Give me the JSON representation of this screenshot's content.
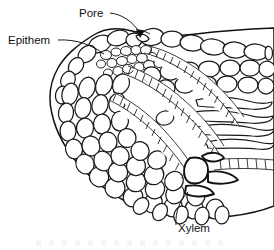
{
  "figure": {
    "name": "hydathode-cross-section",
    "background_color": "#ffffff",
    "line_color": "#1a1a1a",
    "width": 274,
    "height": 250,
    "style": "black-and-white botanical line drawing"
  },
  "labels": [
    {
      "id": "pore",
      "text": "Pore",
      "text_x": 79,
      "text_y": 17,
      "leader": "M 110 13 C 122 14, 133 22, 140 33",
      "arrow": "M 140 38 L 136 29 L 144.5 30.5 Z",
      "has_arrowhead": true
    },
    {
      "id": "epithem",
      "text": "Epithem",
      "text_x": 8,
      "text_y": 44,
      "leader": "M 58 40 C 76 39, 92 45, 104 54",
      "arrow": "",
      "has_arrowhead": false
    },
    {
      "id": "xylem",
      "text": "Xylem",
      "text_x": 178,
      "text_y": 232,
      "leader": "M 176 225 C 175 212, 180 200, 188 192",
      "arrow": "",
      "has_arrowhead": false
    }
  ],
  "regions": [
    {
      "id": "upper-epidermis",
      "description": "Row of large oval epidermal cells along the top, sloping down to the right"
    },
    {
      "id": "pore-gap",
      "description": "Opening in the upper epidermis where the water pore sits"
    },
    {
      "id": "epithem-tissue",
      "description": "Cluster of small loosely packed epithem cells beneath the pore"
    },
    {
      "id": "parenchyma",
      "description": "Rounded mesophyll parenchyma cells filling the left and lower body"
    },
    {
      "id": "xylem-bundle",
      "description": "Curved ladder-like bands of narrow elongated xylem tracheids entering from the right"
    },
    {
      "id": "lower-epidermis",
      "description": "Row of cells along the lower boundary sloping down to the right"
    }
  ],
  "caption_fragment": ""
}
